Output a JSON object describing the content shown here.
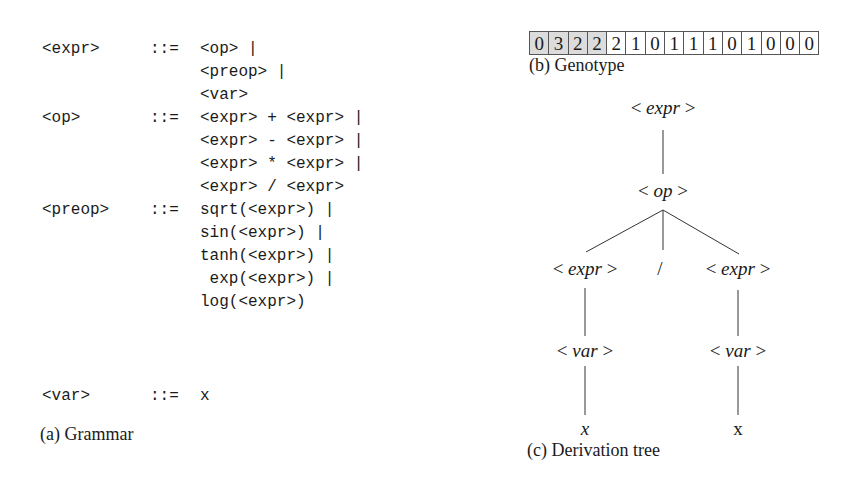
{
  "grammar": {
    "caption": "(a) Grammar",
    "rules": [
      {
        "lhs": "<expr>",
        "def": "::=",
        "rhs": [
          "<op> |",
          "<preop> |",
          "<var>"
        ]
      },
      {
        "lhs": "<op>",
        "def": "::=",
        "rhs": [
          "<expr> + <expr> |",
          "<expr> - <expr> |",
          "<expr> * <expr> |",
          "<expr> / <expr>"
        ]
      },
      {
        "lhs": "<preop>",
        "def": "::=",
        "rhs": [
          "sqrt(<expr>) |",
          "sin(<expr>) |",
          "tanh(<expr>) |",
          " exp(<expr>) |",
          "log(<expr>)"
        ]
      },
      {
        "lhs": "<var>",
        "def": "::=",
        "rhs": [
          "x"
        ]
      }
    ]
  },
  "genotype": {
    "caption": "(b) Genotype",
    "codons": [
      "0",
      "3",
      "2",
      "2",
      "2",
      "1",
      "0",
      "1",
      "1",
      "1",
      "0",
      "1",
      "0",
      "0",
      "0"
    ],
    "shaded_count": 4,
    "shade_color": "#dcdcdc"
  },
  "tree": {
    "caption": "(c) Derivation tree",
    "nodes": {
      "root": "expr",
      "op": "op",
      "left_expr": "expr",
      "slash": "/",
      "right_expr": "expr",
      "left_var": "var",
      "right_var": "var",
      "left_x": "x",
      "right_x": "x"
    }
  }
}
